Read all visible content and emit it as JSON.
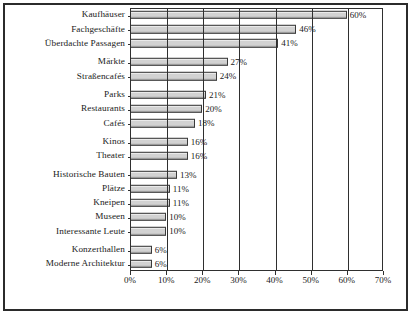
{
  "chart_data": {
    "type": "bar",
    "orientation": "horizontal",
    "title": "",
    "xlabel": "",
    "ylabel": "",
    "xlim": [
      0,
      70
    ],
    "grid": true,
    "legend": null,
    "tick_labels": [
      "0%",
      "10%",
      "20%",
      "30%",
      "40%",
      "50%",
      "60%",
      "70%"
    ],
    "tick_values": [
      0,
      10,
      20,
      30,
      40,
      50,
      60,
      70
    ],
    "categories": [
      "Kaufhäuser",
      "Fachgeschäfte",
      "Überdachte Passagen",
      "Märkte",
      "Straßencafés",
      "Parks",
      "Restaurants",
      "Cafés",
      "Kinos",
      "Theater",
      "Historische Bauten",
      "Plätze",
      "Kneipen",
      "Museen",
      "Interessante Leute",
      "Konzerthallen",
      "Moderne Architektur"
    ],
    "values": [
      60,
      46,
      41,
      27,
      24,
      21,
      20,
      18,
      16,
      16,
      13,
      11,
      11,
      10,
      10,
      6,
      6
    ],
    "value_labels": [
      "60%",
      "46%",
      "41%",
      "27%",
      "24%",
      "21%",
      "20%",
      "18%",
      "16%",
      "16%",
      "13%",
      "11%",
      "11%",
      "10%",
      "10%",
      "6%",
      "6%"
    ],
    "group_breaks_after": [
      2,
      4,
      7,
      9,
      14
    ],
    "bar_color": "#d2d2d2",
    "bar_edge_color": "#3a3a3a",
    "axis_color": "#2f2f2f",
    "background": "#ffffff"
  }
}
